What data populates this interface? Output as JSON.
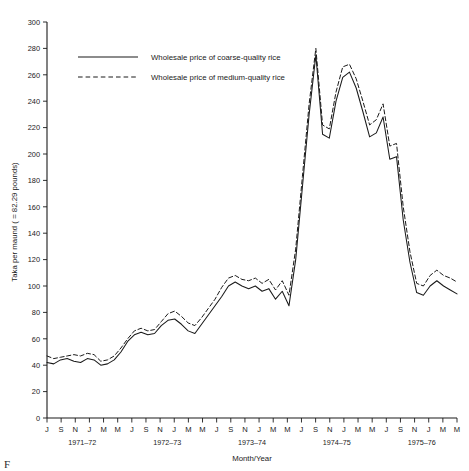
{
  "chart_data": {
    "type": "line",
    "title": "",
    "xlabel": "Month/Year",
    "ylabel": "Taka per maund ( = 82.29 pounds)",
    "ylim": [
      0,
      300
    ],
    "ytick_step": 20,
    "yticks": [
      0,
      20,
      40,
      60,
      80,
      100,
      120,
      140,
      160,
      180,
      200,
      220,
      240,
      260,
      280,
      300
    ],
    "grid": false,
    "legend_position": "top-left-inside",
    "month_tick_labels": [
      "J",
      "S",
      "N",
      "J",
      "M",
      "M",
      "J",
      "S",
      "N",
      "J",
      "M",
      "M",
      "J",
      "S",
      "N",
      "J",
      "M",
      "M",
      "J",
      "S",
      "N",
      "J",
      "M",
      "M",
      "J",
      "S",
      "N",
      "J",
      "M",
      "M"
    ],
    "year_groups": [
      "1971–72",
      "1972–73",
      "1973–74",
      "1974–75",
      "1975–76"
    ],
    "series": [
      {
        "name": "Wholesale price of coarse-quality rice",
        "style": "solid",
        "values": [
          42,
          41,
          44,
          45,
          43,
          42,
          45,
          44,
          40,
          41,
          44,
          50,
          58,
          63,
          65,
          63,
          64,
          70,
          74,
          75,
          71,
          66,
          64,
          71,
          78,
          85,
          92,
          100,
          103,
          100,
          98,
          100,
          96,
          98,
          90,
          96,
          85,
          120,
          175,
          230,
          275,
          215,
          212,
          240,
          258,
          262,
          250,
          232,
          213,
          216,
          228,
          196,
          198,
          150,
          118,
          95,
          93,
          100,
          104,
          100,
          97,
          94
        ]
      },
      {
        "name": "Wholesale price of medium-quality rice",
        "style": "dashed",
        "values": [
          47,
          45,
          46,
          47,
          48,
          47,
          49,
          48,
          43,
          44,
          47,
          53,
          60,
          66,
          68,
          66,
          67,
          73,
          79,
          81,
          77,
          72,
          70,
          76,
          83,
          90,
          99,
          106,
          108,
          105,
          104,
          106,
          102,
          105,
          97,
          104,
          93,
          128,
          183,
          238,
          280,
          222,
          219,
          247,
          266,
          268,
          257,
          240,
          222,
          226,
          238,
          206,
          208,
          160,
          126,
          102,
          100,
          108,
          112,
          108,
          106,
          103
        ]
      }
    ],
    "annotations": {
      "corner_mark": "F"
    }
  }
}
